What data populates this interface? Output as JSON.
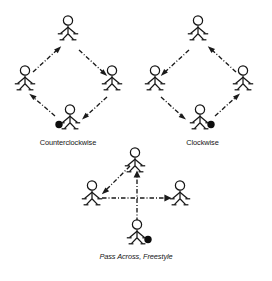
{
  "figure": {
    "captions": {
      "counterclockwise": "Counterclockwise",
      "clockwise": "Clockwise",
      "pass_across": "Pass Across, Freestyle"
    }
  },
  "colors": {
    "ink": "#161616",
    "ball": "#0d0d0d",
    "background": "#ffffff",
    "path": "#1a1a1a"
  },
  "icons": {
    "player": "stick-figure-player-icon",
    "ball": "soccer-ball-icon",
    "arrow": "arrowhead-icon"
  },
  "diagrams": [
    {
      "id": "counterclockwise",
      "label": "Counterclockwise",
      "shape": "diamond",
      "players": [
        {
          "id": "top",
          "position": "top",
          "x": 68,
          "y": 18,
          "has_ball": false
        },
        {
          "id": "left",
          "position": "left",
          "x": 25,
          "y": 68,
          "has_ball": false
        },
        {
          "id": "right",
          "position": "right",
          "x": 112,
          "y": 68,
          "has_ball": false
        },
        {
          "id": "bottom",
          "position": "bottom",
          "x": 70,
          "y": 107,
          "has_ball": true,
          "ball_side": "left"
        }
      ],
      "passes": [
        {
          "from": "bottom",
          "to": "left",
          "style": "dash-dot",
          "arrow": "end"
        },
        {
          "from": "left",
          "to": "top",
          "style": "dash-dot",
          "arrow": "end"
        },
        {
          "from": "top",
          "to": "right",
          "style": "dash-dot",
          "arrow": "end"
        },
        {
          "from": "right",
          "to": "bottom",
          "style": "dash-dot",
          "arrow": "end"
        }
      ]
    },
    {
      "id": "clockwise",
      "label": "Clockwise",
      "shape": "diamond",
      "players": [
        {
          "id": "top",
          "position": "top",
          "x": 198,
          "y": 18,
          "has_ball": false
        },
        {
          "id": "left",
          "position": "left",
          "x": 155,
          "y": 68,
          "has_ball": false
        },
        {
          "id": "right",
          "position": "right",
          "x": 243,
          "y": 68,
          "has_ball": false
        },
        {
          "id": "bottom",
          "position": "bottom",
          "x": 200,
          "y": 107,
          "has_ball": true,
          "ball_side": "right"
        }
      ],
      "passes": [
        {
          "from": "bottom",
          "to": "right",
          "style": "dash-dot",
          "arrow": "end"
        },
        {
          "from": "right",
          "to": "top",
          "style": "dash-dot",
          "arrow": "end"
        },
        {
          "from": "top",
          "to": "left",
          "style": "dash-dot",
          "arrow": "end"
        },
        {
          "from": "left",
          "to": "bottom",
          "style": "dash-dot",
          "arrow": "end"
        }
      ]
    },
    {
      "id": "pass-across-freestyle",
      "label": "Pass Across, Freestyle",
      "shape": "diamond",
      "players": [
        {
          "id": "top",
          "position": "top",
          "x": 135,
          "y": 152,
          "has_ball": false
        },
        {
          "id": "left",
          "position": "left",
          "x": 92,
          "y": 183,
          "has_ball": false
        },
        {
          "id": "right",
          "position": "right",
          "x": 180,
          "y": 183,
          "has_ball": false
        },
        {
          "id": "bottom",
          "position": "bottom",
          "x": 137,
          "y": 218,
          "has_ball": true,
          "ball_side": "right"
        }
      ],
      "passes": [
        {
          "from": "bottom",
          "to": "top",
          "style": "dash-dot",
          "arrow": "end",
          "direction": "vertical-up"
        },
        {
          "from": "top",
          "to": "left",
          "style": "dash-dot",
          "arrow": "end",
          "direction": "diagonal-down-left"
        },
        {
          "from": "left",
          "to": "right",
          "style": "dash-dot",
          "arrow": "end",
          "direction": "horizontal-right"
        }
      ]
    }
  ]
}
